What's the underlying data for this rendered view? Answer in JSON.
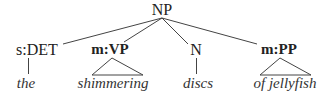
{
  "tree": {
    "root": {
      "label": "NP"
    },
    "children": [
      {
        "label": "s:DET",
        "bold": false,
        "leaf": "the",
        "edge": "line"
      },
      {
        "label": "m:VP",
        "bold": true,
        "leaf": "shimmering",
        "edge": "triangle"
      },
      {
        "label": "N",
        "bold": false,
        "leaf": "discs",
        "edge": "line"
      },
      {
        "label": "m:PP",
        "bold": true,
        "leaf": "of jellyfish",
        "edge": "triangle"
      }
    ]
  },
  "colors": {
    "line": "#444444",
    "text": "#222222"
  }
}
